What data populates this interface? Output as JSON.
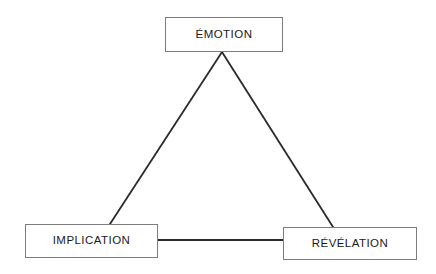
{
  "diagram": {
    "type": "triangle-relationship-diagram",
    "background_color": "#ffffff",
    "node_border_color": "#7d7d7d",
    "edge_color": "#2a2a2a",
    "text_color": "#1a1a1a",
    "nodes": [
      {
        "id": "emotion",
        "label": "ÉMOTION",
        "position": "top",
        "x": 165,
        "y": 17,
        "width": 118,
        "height": 35
      },
      {
        "id": "implication",
        "label": "IMPLICATION",
        "position": "bottom-left",
        "x": 25,
        "y": 224,
        "width": 133,
        "height": 34
      },
      {
        "id": "revelation",
        "label": "RÉVÉLATION",
        "position": "bottom-right",
        "x": 283,
        "y": 227,
        "width": 134,
        "height": 33
      }
    ],
    "edges": [
      {
        "id": "emotion-implication",
        "from": "emotion",
        "to": "implication",
        "x1": 222,
        "y1": 52,
        "x2": 110,
        "y2": 224,
        "width": 1.8
      },
      {
        "id": "emotion-revelation",
        "from": "emotion",
        "to": "revelation",
        "x1": 222,
        "y1": 52,
        "x2": 333,
        "y2": 227,
        "width": 1.8
      },
      {
        "id": "implication-revelation",
        "from": "implication",
        "to": "revelation",
        "x1": 158,
        "y1": 240,
        "x2": 283,
        "y2": 240,
        "width": 2.2
      }
    ]
  }
}
